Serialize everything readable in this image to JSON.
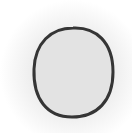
{
  "image": {
    "description": "Gray oval with dark outline on soft radial gray background",
    "shape": "oval",
    "colors": {
      "background": "#ffffff",
      "glow": "#ececec",
      "fill": "#e3e3e3",
      "stroke": "#333333"
    },
    "geometry": {
      "cx": 73.5,
      "cy": 72.5,
      "rx": 39.5,
      "ry": 43.5,
      "stroke_width": 3
    }
  }
}
